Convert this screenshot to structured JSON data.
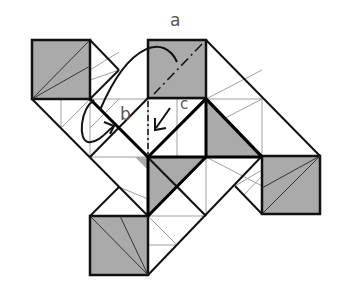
{
  "diagram": {
    "labels": {
      "a": "a",
      "b": "b",
      "c": "c"
    },
    "colors": {
      "background": "#ffffff",
      "shaded": "#aaaaaa",
      "bold_line": "#111111",
      "thin_line": "#999999",
      "label": "#555555"
    },
    "shaded_squares": [
      "top-left",
      "top-right",
      "right",
      "bottom"
    ],
    "shaded_triangles": [
      "center-upper",
      "center-lower",
      "center-right"
    ],
    "annotations": [
      {
        "label": "a",
        "description": "mountain fold (dash-dot) diagonal in top-right square with curved arrow"
      },
      {
        "label": "b",
        "description": "looped arrow indicating fold behind"
      },
      {
        "label": "c",
        "description": "arrow indicating valley fold along dashed line"
      }
    ]
  }
}
